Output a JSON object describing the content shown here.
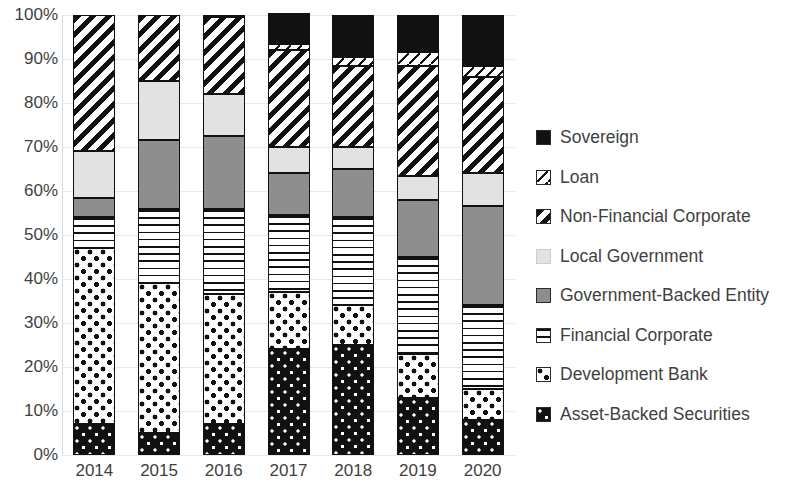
{
  "chart_data": {
    "type": "bar",
    "subtype": "stacked-100-percent",
    "title": "",
    "xlabel": "",
    "ylabel": "",
    "categories": [
      "2014",
      "2015",
      "2016",
      "2017",
      "2018",
      "2019",
      "2020"
    ],
    "ylim": [
      0,
      100
    ],
    "ytick_labels": [
      "0%",
      "10%",
      "20%",
      "30%",
      "40%",
      "50%",
      "60%",
      "70%",
      "80%",
      "90%",
      "100%"
    ],
    "ytick_values": [
      0,
      10,
      20,
      30,
      40,
      50,
      60,
      70,
      80,
      90,
      100
    ],
    "grid": true,
    "grid_axis": "y",
    "legend_position": "right",
    "stack_order_bottom_to_top": [
      "Asset-Backed Securities",
      "Development Bank",
      "Financial Corporate",
      "Government-Backed Entity",
      "Local Government",
      "Non-Financial Corporate",
      "Loan",
      "Sovereign"
    ],
    "series": [
      {
        "name": "Asset-Backed Securities",
        "pattern": "dark-with-white-dots",
        "color": "#111111",
        "values": [
          7.0,
          5.0,
          7.0,
          24.0,
          25.0,
          13.0,
          8.0
        ]
      },
      {
        "name": "Development Bank",
        "pattern": "white-with-black-dots",
        "color": "#ffffff",
        "values": [
          40.0,
          34.0,
          29.5,
          13.0,
          9.0,
          10.0,
          7.0
        ]
      },
      {
        "name": "Financial Corporate",
        "pattern": "horizontal-lines",
        "color": "#ffffff",
        "values": [
          7.0,
          17.0,
          19.5,
          17.5,
          20.0,
          22.0,
          19.0
        ]
      },
      {
        "name": "Government-Backed Entity",
        "pattern": "solid-medium-gray",
        "color": "#8e8e8e",
        "values": [
          4.5,
          15.5,
          16.5,
          9.5,
          11.0,
          13.0,
          22.5
        ]
      },
      {
        "name": "Local Government",
        "pattern": "solid-light-gray",
        "color": "#e2e2e2",
        "values": [
          10.5,
          13.5,
          9.5,
          6.0,
          5.0,
          5.5,
          7.5
        ]
      },
      {
        "name": "Non-Financial Corporate",
        "pattern": "diagonal-stripes",
        "color": "#ffffff",
        "values": [
          31.0,
          15.0,
          17.5,
          22.0,
          18.5,
          25.0,
          22.0
        ]
      },
      {
        "name": "Loan",
        "pattern": "white-single-diagonal",
        "color": "#ffffff",
        "values": [
          0.0,
          0.0,
          0.0,
          1.5,
          2.0,
          3.0,
          2.5
        ]
      },
      {
        "name": "Sovereign",
        "pattern": "solid-black",
        "color": "#111111",
        "values": [
          0.0,
          0.0,
          0.5,
          7.0,
          9.5,
          8.5,
          11.5
        ]
      }
    ]
  },
  "legend": {
    "items": [
      {
        "label": "Sovereign",
        "swatch": "p-sovereign"
      },
      {
        "label": "Loan",
        "swatch": "p-loan"
      },
      {
        "label": "Non-Financial Corporate",
        "swatch": "p-nonfin"
      },
      {
        "label": "Local Government",
        "swatch": "p-localgov"
      },
      {
        "label": "Government-Backed Entity",
        "swatch": "p-govbacked"
      },
      {
        "label": "Financial Corporate",
        "swatch": "p-fincorp"
      },
      {
        "label": "Development Bank",
        "swatch": "p-devbank"
      },
      {
        "label": "Asset-Backed Securities",
        "swatch": "p-abs"
      }
    ]
  }
}
